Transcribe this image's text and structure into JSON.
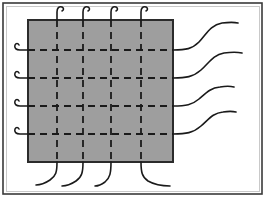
{
  "figure": {
    "canvas": {
      "width": 266,
      "height": 198,
      "background": "#ffffff"
    },
    "outer_frame": {
      "label": "figure border",
      "x": 3,
      "y": 3,
      "width": 259,
      "height": 191,
      "stroke": "#3a3a3a",
      "stroke_width": 1.6
    },
    "inner_frame": {
      "label": "inner hairline border",
      "x": 6,
      "y": 6,
      "width": 253,
      "height": 185,
      "stroke": "#c9c9c9",
      "stroke_width": 1
    },
    "block": {
      "label": "shaded rectangular block",
      "x": 28,
      "y": 20,
      "width": 145,
      "height": 142,
      "fill": "#9e9e9e",
      "stroke": "#2b2b2b",
      "stroke_width": 1.6
    },
    "grid": {
      "label": "dashed internal grid",
      "stroke": "#1a1a1a",
      "stroke_width": 1.8,
      "dash_pattern": "7 5",
      "vertical_count": 4,
      "horizontal_count": 4,
      "vertical_x": [
        57,
        83,
        111,
        141
      ],
      "horizontal_y": [
        50,
        78,
        106,
        134
      ]
    },
    "top_stubs": {
      "label": "hooked fiber stubs at top edge",
      "count": 4,
      "stroke": "#1a1a1a",
      "stroke_width": 1.6,
      "paths": [
        "M57,20 L57,12 C57,8 59,6 62,7 C64,8 64,10 62,11",
        "M83,20 L83,12 C83,8 85,6 88,7 C90,8 90,10 88,11",
        "M111,20 L111,12 C111,8 113,6 116,7 C118,8 118,10 116,11",
        "M141,20 L141,12 C141,8 143,6 146,7 C148,8 148,10 146,11"
      ]
    },
    "left_stubs": {
      "label": "hooked fiber stubs at left edge",
      "count": 4,
      "stroke": "#1a1a1a",
      "stroke_width": 1.6,
      "paths": [
        "M28,50 L20,50 C16,50 14,48 15,45 C16,43 18,43 19,45",
        "M28,78 L20,78 C16,78 14,76 15,73 C16,71 18,71 19,73",
        "M28,106 L20,106 C16,106 14,104 15,101 C16,99 18,99 19,101",
        "M28,134 L20,134 C16,134 14,132 15,129 C16,127 18,127 19,129"
      ]
    },
    "right_curves": {
      "label": "wavy fibers exiting right edge",
      "count": 4,
      "stroke": "#1a1a1a",
      "stroke_width": 1.6,
      "paths": [
        "M173,50 C186,50 192,49 199,42 C206,35 210,25 222,23 C230,22 234,22 238,23",
        "M173,78 C186,78 193,77 201,70 C209,63 213,55 224,53 C232,52 237,52 242,53",
        "M173,106 C186,106 192,105 199,99 C206,93 210,88 220,87 C226,86 230,86 234,87",
        "M173,134 C186,134 193,133 201,126 C209,119 213,113 223,112 C229,111 232,111 236,112"
      ]
    },
    "bottom_curves": {
      "label": "wavy fibers exiting bottom edge",
      "count": 4,
      "stroke": "#1a1a1a",
      "stroke_width": 1.6,
      "paths": [
        "M57,162 C57,172 56,176 50,180 C44,184 40,185 36,185",
        "M83,162 C83,172 82,177 76,181 C70,185 66,186 62,186",
        "M111,162 C111,173 110,178 105,182 C101,185 98,186 95,186",
        "M141,162 C141,172 142,177 148,181 C155,185 162,186 170,186"
      ]
    }
  }
}
